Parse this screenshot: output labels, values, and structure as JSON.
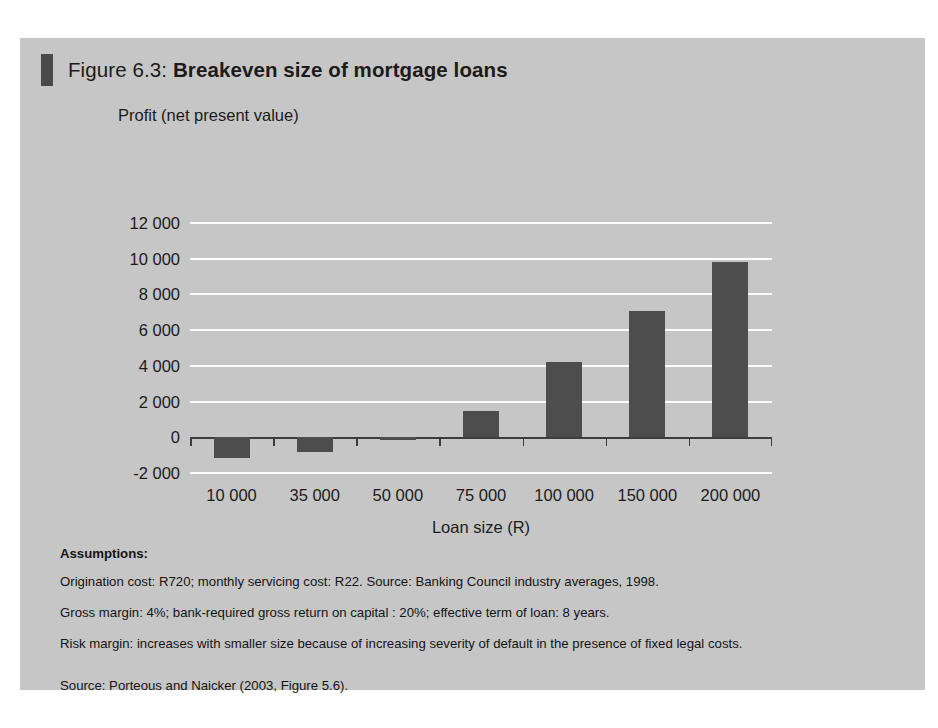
{
  "figure": {
    "title_prefix": "Figure 6.3: ",
    "title_main": "Breakeven size of mortgage loans"
  },
  "notes": {
    "heading": "Assumptions:",
    "lines": [
      "Origination cost: R720; monthly servicing cost: R22. Source: Banking Council industry averages, 1998.",
      "Gross margin: 4%; bank-required gross return on capital : 20%; effective term of loan: 8 years.",
      "Risk margin: increases with smaller size because of increasing severity of default in the presence of fixed legal costs."
    ],
    "source": "Source: Porteous and Naicker (2003, Figure 5.6)."
  },
  "colors": {
    "panel_background": "#c6c6c6",
    "bar_fill": "#4d4d4d",
    "gridline": "#fdfdfd",
    "axis_line": "#3d3d3d",
    "title_marker": "#4a4a4a",
    "text": "#1b1b1b"
  },
  "chart_data": {
    "type": "bar",
    "title": "Breakeven size of mortgage loans",
    "xlabel": "Loan size (R)",
    "ylabel": "Profit (net present value)",
    "categories": [
      "10 000",
      "35 000",
      "50 000",
      "75 000",
      "100 000",
      "150 000",
      "200 000"
    ],
    "values": [
      -1150,
      -800,
      -150,
      1500,
      4200,
      7050,
      9800
    ],
    "ylim": [
      -2000,
      12000
    ],
    "ytick_labels": [
      "12 000",
      "10 000",
      "8 000",
      "6 000",
      "4 000",
      "2 000",
      "0",
      "-2 000"
    ],
    "ytick_values": [
      12000,
      10000,
      8000,
      6000,
      4000,
      2000,
      0,
      -2000
    ],
    "grid": true,
    "legend": "none",
    "series": [
      {
        "name": "Profit (net present value)",
        "values": [
          -1150,
          -800,
          -150,
          1500,
          4200,
          7050,
          9800
        ]
      }
    ]
  }
}
